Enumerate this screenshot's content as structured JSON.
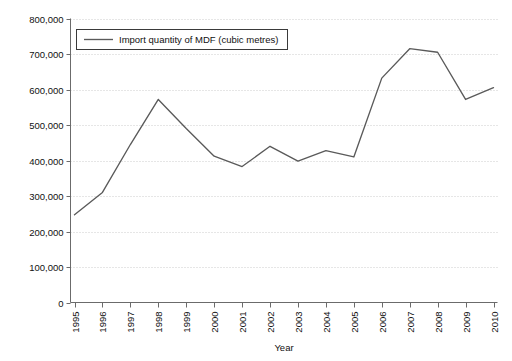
{
  "chart_data": {
    "type": "line",
    "title": "",
    "subtitle": "",
    "xlabel": "Year",
    "ylabel": "",
    "categories": [
      "1995",
      "1996",
      "1997",
      "1998",
      "1999",
      "2000",
      "2001",
      "2002",
      "2003",
      "2004",
      "2005",
      "2006",
      "2007",
      "2008",
      "2009",
      "2010"
    ],
    "series": [
      {
        "name": "Import quantity of MDF (cubic metres)",
        "values": [
          247000,
          310000,
          445000,
          572000,
          490000,
          412000,
          383000,
          440000,
          398000,
          428000,
          410000,
          632000,
          715000,
          705000,
          572000,
          605000
        ],
        "color": "#5a5a5a"
      }
    ],
    "ylim": [
      0,
      800000
    ],
    "ytick_values": [
      0,
      100000,
      200000,
      300000,
      400000,
      500000,
      600000,
      700000,
      800000
    ],
    "ytick_labels": [
      "0",
      "100,000",
      "200,000",
      "300,000",
      "400,000",
      "500,000",
      "600,000",
      "700,000",
      "800,000"
    ],
    "xtick_labels": [
      "1995",
      "1996",
      "1997",
      "1998",
      "1999",
      "2000",
      "2001",
      "2002",
      "2003",
      "2004",
      "2005",
      "2006",
      "2007",
      "2008",
      "2009",
      "2010"
    ],
    "xtick_rotation": -90,
    "grid": true,
    "grid_axis": "y",
    "legend": {
      "position": "top-left-inside",
      "entries": [
        "Import quantity of MDF (cubic metres)"
      ]
    },
    "colors": {
      "line": "#5a5a5a",
      "axis": "#6b6b6b",
      "grid": "#b9b9b9",
      "text": "#111111",
      "background": "#ffffff",
      "legend_border": "#3a3a3a"
    }
  }
}
